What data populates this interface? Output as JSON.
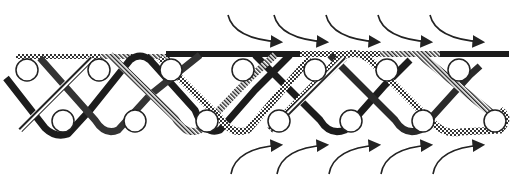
{
  "figure": {
    "colors": {
      "background": "#ffffff",
      "ink": "#1a1a1a",
      "dark_strand": "#1c1c1c",
      "roller_stroke": "#222222",
      "roller_fill": "#ffffff"
    },
    "rollers": {
      "top_row": {
        "y": 70,
        "x": [
          27,
          99,
          171,
          243,
          315,
          387,
          459
        ],
        "r": 11
      },
      "bottom_row": {
        "y": 121,
        "x": [
          63,
          135,
          207,
          279,
          351,
          423,
          495
        ],
        "r": 11
      }
    },
    "top_arrows": {
      "count": 5,
      "direction": "right",
      "start_x": [
        228,
        274,
        326,
        378,
        430
      ]
    },
    "bottom_arrows": {
      "count": 5,
      "direction": "right",
      "start_x": [
        231,
        277,
        329,
        381,
        433
      ]
    }
  }
}
